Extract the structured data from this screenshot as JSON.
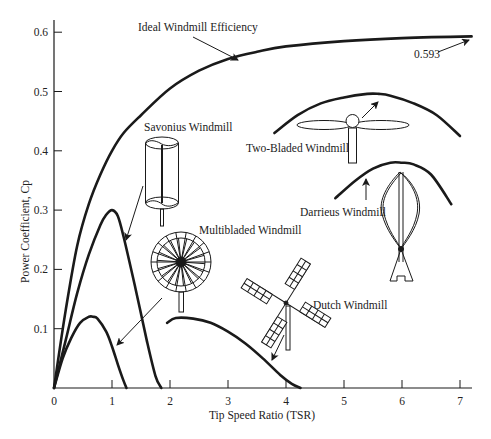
{
  "chart_data": {
    "type": "line",
    "title": "",
    "xlabel": "Tip Speed Ratio (TSR)",
    "ylabel": "Power Coefficient, Cp",
    "xlim": [
      0,
      7.2
    ],
    "ylim": [
      0,
      0.62
    ],
    "xticks": [
      0,
      1,
      2,
      3,
      4,
      5,
      6,
      7
    ],
    "yticks": [
      0.1,
      0.2,
      0.3,
      0.4,
      0.5,
      0.6
    ],
    "xtick_labels": [
      "0",
      "1",
      "2",
      "3",
      "4",
      "5",
      "6",
      "7"
    ],
    "ytick_labels": [
      "0.1",
      "0.2",
      "0.3",
      "0.4",
      "0.5",
      "0.6"
    ],
    "grid": false,
    "legend": "none (inline annotations)",
    "series": [
      {
        "name": "Ideal Windmill Efficiency",
        "x": [
          0,
          0.2,
          0.4,
          0.6,
          0.8,
          1.0,
          1.2,
          1.5,
          2.0,
          2.5,
          3.0,
          3.5,
          4.0,
          5.0,
          6.0,
          7.2
        ],
        "y": [
          0,
          0.13,
          0.24,
          0.31,
          0.36,
          0.4,
          0.43,
          0.46,
          0.505,
          0.535,
          0.555,
          0.567,
          0.576,
          0.585,
          0.59,
          0.593
        ]
      },
      {
        "name": "Savonius Windmill",
        "x": [
          0,
          0.2,
          0.4,
          0.6,
          0.8,
          0.9,
          1.0,
          1.1,
          1.2,
          1.4,
          1.6,
          1.75,
          1.85
        ],
        "y": [
          0,
          0.08,
          0.16,
          0.225,
          0.275,
          0.292,
          0.3,
          0.29,
          0.255,
          0.17,
          0.08,
          0.02,
          0
        ]
      },
      {
        "name": "Multibladed Windmill",
        "x": [
          0,
          0.15,
          0.3,
          0.45,
          0.6,
          0.67,
          0.75,
          0.9,
          1.0,
          1.1,
          1.2,
          1.25
        ],
        "y": [
          0,
          0.05,
          0.085,
          0.11,
          0.12,
          0.12,
          0.117,
          0.095,
          0.07,
          0.04,
          0.012,
          0
        ]
      },
      {
        "name": "Dutch Windmill",
        "x": [
          1.95,
          2.1,
          2.4,
          2.7,
          3.0,
          3.3,
          3.6,
          3.9,
          4.1,
          4.25
        ],
        "y": [
          0.11,
          0.118,
          0.117,
          0.11,
          0.095,
          0.075,
          0.05,
          0.022,
          0.007,
          0
        ]
      },
      {
        "name": "Two-Bladed Windmill",
        "x": [
          3.8,
          4.2,
          4.6,
          5.0,
          5.4,
          5.6,
          5.8,
          6.2,
          6.6,
          7.0
        ],
        "y": [
          0.43,
          0.46,
          0.48,
          0.49,
          0.496,
          0.496,
          0.493,
          0.48,
          0.46,
          0.425
        ]
      },
      {
        "name": "Darrieus Windmill",
        "x": [
          4.85,
          5.2,
          5.5,
          5.8,
          6.0,
          6.2,
          6.5,
          6.85
        ],
        "y": [
          0.32,
          0.35,
          0.37,
          0.38,
          0.38,
          0.377,
          0.36,
          0.31
        ]
      }
    ],
    "annotations": [
      {
        "text": "Ideal Windmill Efficiency",
        "x": 1.5,
        "y": 0.6
      },
      {
        "text": "0.593",
        "x": 6.2,
        "y": 0.565,
        "arrow_to": [
          7.2,
          0.593
        ]
      },
      {
        "text": "Savonius Windmill",
        "x": 1.55,
        "y": 0.44
      },
      {
        "text": "Multibladed Windmill",
        "x": 2.5,
        "y": 0.27
      },
      {
        "text": "Two-Bladed Windmill",
        "x": 3.3,
        "y": 0.41
      },
      {
        "text": "Darrieus Windmill",
        "x": 4.5,
        "y": 0.3
      },
      {
        "text": "Dutch Windmill",
        "x": 4.55,
        "y": 0.14
      }
    ]
  },
  "labels": {
    "ideal": "Ideal Windmill Efficiency",
    "betz": "0.593",
    "savonius": "Savonius Windmill",
    "multibladed": "Multibladed Windmill",
    "two_bladed": "Two-Bladed Windmill",
    "darrieus": "Darrieus Windmill",
    "dutch": "Dutch Windmill",
    "xlabel": "Tip Speed Ratio (TSR)",
    "ylabel": "Power Coefficient, Cp"
  }
}
